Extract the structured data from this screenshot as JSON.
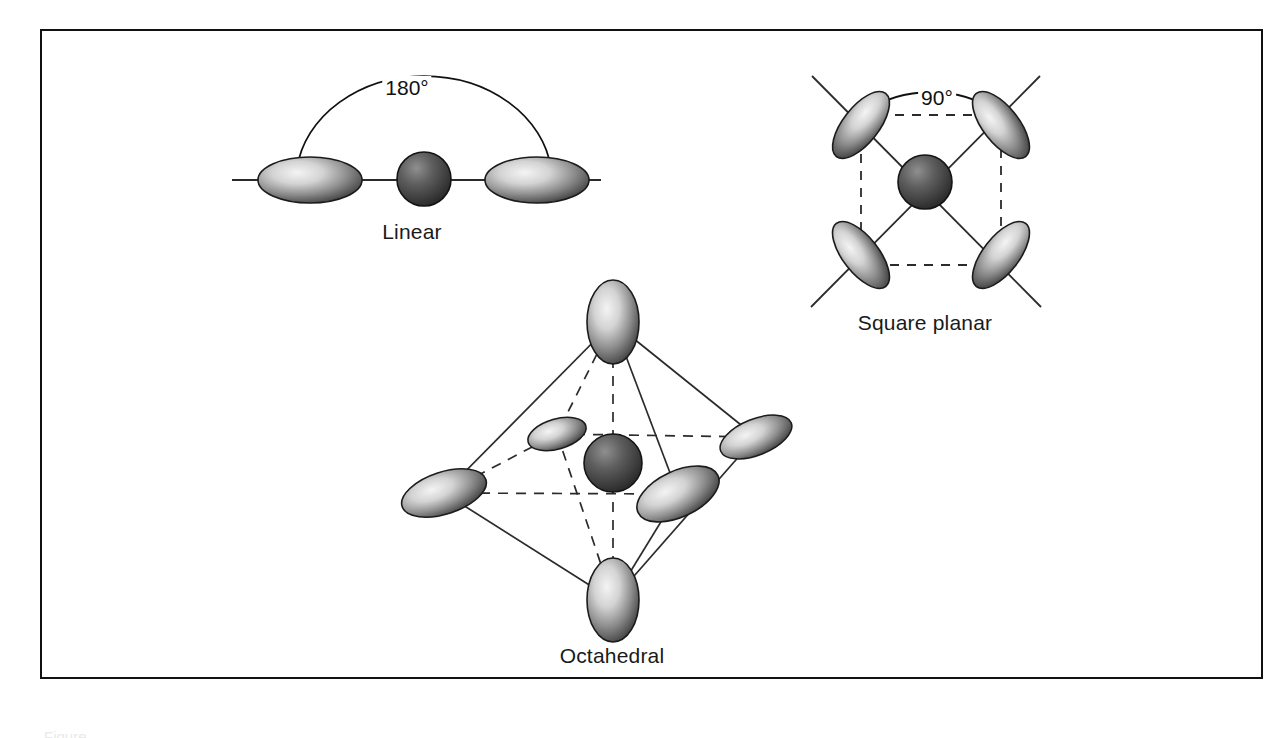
{
  "figure": {
    "background_color": "#ffffff",
    "frame_color": "#111111",
    "title": "",
    "caption_partial": "Figure"
  },
  "palette": {
    "lobe_light": "#f2f2f2",
    "lobe_mid": "#9a9a9a",
    "lobe_dark": "#3b3b3b",
    "lobe_outline": "#1b1b1b",
    "sphere_light": "#8c8c8c",
    "sphere_mid": "#5a5a5a",
    "sphere_dark": "#2a2a2a",
    "sphere_outline": "#141414",
    "bond_line": "#2b2b2b",
    "dashed_line": "#2b2b2b",
    "text": "#1a1a1a"
  },
  "diagrams": [
    {
      "id": "linear",
      "label": "Linear",
      "label_x": 412,
      "label_y": 232,
      "angle_label": "180°",
      "angle_label_x": 407,
      "angle_label_y": 88,
      "center_atom": {
        "cx": 424,
        "cy": 179,
        "r": 27
      },
      "ligand_count": 2,
      "ligands": [
        {
          "cx": 310,
          "cy": 180,
          "rx": 52,
          "ry": 23,
          "rotation": 0
        },
        {
          "cx": 537,
          "cy": 180,
          "rx": 52,
          "ry": 23,
          "rotation": 0
        }
      ],
      "axis_line": {
        "x1": 232,
        "y1": 180,
        "x2": 601,
        "y2": 180
      }
    },
    {
      "id": "square-planar",
      "label": "Square planar",
      "label_x": 925,
      "label_y": 323,
      "angle_label": "90°",
      "angle_label_x": 937,
      "angle_label_y": 98,
      "center_atom": {
        "cx": 925,
        "cy": 182,
        "r": 27
      },
      "ligand_count": 4,
      "ligands": [
        {
          "cx": 861,
          "cy": 125,
          "rx": 18,
          "ry": 40,
          "rotation": 38
        },
        {
          "cx": 1001,
          "cy": 125,
          "rx": 18,
          "ry": 40,
          "rotation": -38
        },
        {
          "cx": 861,
          "cy": 255,
          "rx": 18,
          "ry": 40,
          "rotation": -38
        },
        {
          "cx": 1001,
          "cy": 255,
          "rx": 18,
          "ry": 40,
          "rotation": 38
        }
      ],
      "dashed_square": [
        [
          861,
          115
        ],
        [
          1001,
          115
        ],
        [
          1001,
          265
        ],
        [
          861,
          265
        ]
      ],
      "bond_stubs": 4
    },
    {
      "id": "octahedral",
      "label": "Octahedral",
      "label_x": 612,
      "label_y": 656,
      "angle_label": "",
      "center_atom": {
        "cx": 613,
        "cy": 463,
        "r": 29
      },
      "ligand_count": 6,
      "ligands": [
        {
          "cx": 613,
          "cy": 322,
          "rx": 26,
          "ry": 42,
          "rotation": 0,
          "position": "top"
        },
        {
          "cx": 613,
          "cy": 600,
          "rx": 26,
          "ry": 42,
          "rotation": 0,
          "position": "bottom"
        },
        {
          "cx": 444,
          "cy": 493,
          "rx": 44,
          "ry": 21,
          "rotation": -18,
          "position": "front-left"
        },
        {
          "cx": 678,
          "cy": 494,
          "rx": 44,
          "ry": 23,
          "rotation": -25,
          "position": "front-right"
        },
        {
          "cx": 557,
          "cy": 434,
          "rx": 30,
          "ry": 15,
          "rotation": -16,
          "position": "back-left"
        },
        {
          "cx": 756,
          "cy": 437,
          "rx": 38,
          "ry": 18,
          "rotation": -22,
          "position": "back-right"
        }
      ],
      "solid_edges": [
        [
          613,
          322,
          444,
          493
        ],
        [
          613,
          322,
          678,
          494
        ],
        [
          444,
          493,
          613,
          600
        ],
        [
          678,
          494,
          613,
          600
        ],
        [
          613,
          322,
          756,
          437
        ],
        [
          756,
          437,
          613,
          600
        ]
      ],
      "dashed_edges": [
        [
          613,
          322,
          557,
          434
        ],
        [
          557,
          434,
          613,
          600
        ],
        [
          444,
          493,
          557,
          434
        ],
        [
          557,
          434,
          756,
          437
        ],
        [
          444,
          493,
          678,
          494
        ],
        [
          613,
          322,
          613,
          600
        ]
      ]
    }
  ]
}
